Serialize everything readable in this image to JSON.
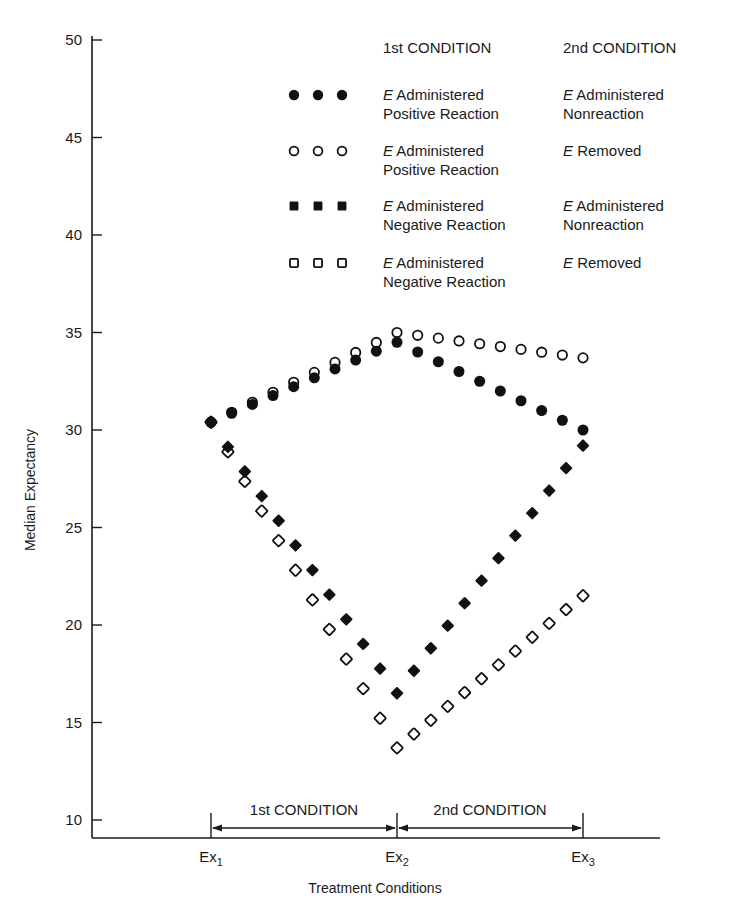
{
  "chart_data": {
    "type": "line",
    "title": "",
    "xlabel": "Treatment Conditions",
    "ylabel": "Median Expectancy",
    "ylim": [
      10,
      50
    ],
    "yticks": [
      10,
      15,
      20,
      25,
      30,
      35,
      40,
      45,
      50
    ],
    "grid": false,
    "legend_position": "top-right",
    "categories": [
      "Ex1",
      "Ex2",
      "Ex3"
    ],
    "category_labels": [
      {
        "base": "Ex",
        "sub": "1"
      },
      {
        "base": "Ex",
        "sub": "2"
      },
      {
        "base": "Ex",
        "sub": "3"
      }
    ],
    "legend_headers": {
      "first": "1st CONDITION",
      "second": "2nd CONDITION"
    },
    "annotations": {
      "span_1": "1st CONDITION",
      "span_2": "2nd CONDITION"
    },
    "series": [
      {
        "name": "E Administered Positive Reaction / E Administered Nonreaction",
        "marker": "filled-circle",
        "first": {
          "italic": "E",
          "line1": " Administered",
          "line2": "Positive Reaction"
        },
        "second": {
          "italic": "E",
          "line1": " Administered",
          "line2": "Nonreaction"
        },
        "values": [
          30.4,
          34.5,
          30.0
        ]
      },
      {
        "name": "E Administered Positive Reaction / E Removed",
        "marker": "open-circle",
        "first": {
          "italic": "E",
          "line1": " Administered",
          "line2": "Positive Reaction"
        },
        "second": {
          "italic": "E",
          "line1": " Removed",
          "line2": ""
        },
        "values": [
          30.4,
          35.0,
          33.7
        ]
      },
      {
        "name": "E Administered Negative Reaction / E Administered Nonreaction",
        "marker": "filled-square",
        "first": {
          "italic": "E",
          "line1": " Administered",
          "line2": "Negative Reaction"
        },
        "second": {
          "italic": "E",
          "line1": " Administered",
          "line2": "Nonreaction"
        },
        "values": [
          30.4,
          16.5,
          29.2
        ]
      },
      {
        "name": "E Administered Negative Reaction / E Removed",
        "marker": "open-square",
        "first": {
          "italic": "E",
          "line1": " Administered",
          "line2": "Negative Reaction"
        },
        "second": {
          "italic": "E",
          "line1": " Removed",
          "line2": ""
        },
        "values": [
          30.4,
          13.7,
          21.5
        ]
      }
    ]
  }
}
